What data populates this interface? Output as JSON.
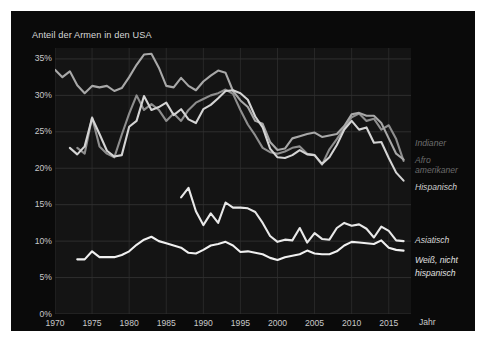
{
  "chart_data": {
    "type": "line",
    "title": "Anteil der Armen in den USA",
    "xlabel": "Jahr",
    "ylabel": "",
    "xlim": [
      1970,
      2018
    ],
    "ylim": [
      0,
      36.5
    ],
    "grid": true,
    "legend_position": "right-inline",
    "y_ticks": [
      "0%",
      "5%",
      "10%",
      "15%",
      "20%",
      "25%",
      "30%",
      "35%"
    ],
    "y_tick_values": [
      0,
      5,
      10,
      15,
      20,
      25,
      30,
      35
    ],
    "x_ticks": [
      "1970",
      "1975",
      "1980",
      "1985",
      "1990",
      "1995",
      "2000",
      "2005",
      "2010",
      "2015"
    ],
    "x_tick_values": [
      1970,
      1975,
      1980,
      1985,
      1990,
      1995,
      2000,
      2005,
      2010,
      2015
    ],
    "series": [
      {
        "name": "Indianer",
        "color": "#8e8e8e",
        "label_color": "#6f6f6f",
        "x": [
          1973,
          1974,
          1975,
          1976,
          1977,
          1978,
          1979,
          1980,
          1981,
          1982,
          1983,
          1984,
          1985,
          1986,
          1987,
          1988,
          1989,
          1990,
          1991,
          1992,
          1993,
          1994,
          1995,
          1996,
          1997,
          1998,
          1999,
          2000,
          2001,
          2002,
          2003,
          2004,
          2005,
          2006,
          2007,
          2008,
          2009,
          2010,
          2011,
          2012,
          2013,
          2014,
          2015,
          2016,
          2017
        ],
        "y": [
          22.8,
          22.0,
          27.0,
          23.0,
          22.0,
          21.5,
          24.6,
          27.5,
          30.0,
          28.0,
          28.8,
          28.0,
          26.5,
          27.5,
          26.5,
          28.0,
          29.0,
          29.5,
          30.0,
          30.3,
          30.8,
          30.2,
          28.0,
          26.0,
          24.5,
          22.8,
          22.2,
          22.0,
          22.3,
          22.8,
          23.0,
          22.0,
          21.8,
          20.5,
          22.6,
          24.0,
          25.5,
          27.0,
          27.5,
          26.5,
          26.8,
          25.3,
          25.9,
          24.0,
          21.0
        ]
      },
      {
        "name": "Afro-amerikaner",
        "color": "#a8a8a8",
        "label_color": "#6a6a6a",
        "x": [
          1970,
          1971,
          1972,
          1973,
          1974,
          1975,
          1976,
          1977,
          1978,
          1979,
          1980,
          1981,
          1982,
          1983,
          1984,
          1985,
          1986,
          1987,
          1988,
          1989,
          1990,
          1991,
          1992,
          1993,
          1994,
          1995,
          1996,
          1997,
          1998,
          1999,
          2000,
          2001,
          2002,
          2003,
          2004,
          2005,
          2006,
          2007,
          2008,
          2009,
          2010,
          2011,
          2012,
          2013,
          2014,
          2015,
          2016,
          2017
        ],
        "y": [
          33.5,
          32.5,
          33.3,
          31.4,
          30.3,
          31.3,
          31.1,
          31.3,
          30.6,
          31.0,
          32.5,
          34.2,
          35.6,
          35.7,
          33.8,
          31.3,
          31.1,
          32.4,
          31.3,
          30.7,
          31.9,
          32.7,
          33.4,
          33.1,
          30.6,
          29.3,
          28.4,
          26.5,
          26.1,
          23.6,
          22.5,
          22.7,
          24.1,
          24.4,
          24.7,
          24.9,
          24.3,
          24.5,
          24.7,
          25.8,
          27.4,
          27.6,
          27.2,
          27.2,
          26.2,
          24.1,
          22.0,
          21.2
        ]
      },
      {
        "name": "Hispanisch",
        "color": "#d4d4d4",
        "label_color": "#cfcfcf",
        "x": [
          1972,
          1973,
          1974,
          1975,
          1976,
          1977,
          1978,
          1979,
          1980,
          1981,
          1982,
          1983,
          1984,
          1985,
          1986,
          1987,
          1988,
          1989,
          1990,
          1991,
          1992,
          1993,
          1994,
          1995,
          1996,
          1997,
          1998,
          1999,
          2000,
          2001,
          2002,
          2003,
          2004,
          2005,
          2006,
          2007,
          2008,
          2009,
          2010,
          2011,
          2012,
          2013,
          2014,
          2015,
          2016,
          2017
        ],
        "y": [
          22.8,
          21.9,
          23.0,
          26.9,
          24.7,
          22.4,
          21.6,
          21.8,
          25.7,
          26.5,
          29.9,
          28.0,
          28.4,
          29.0,
          27.3,
          28.1,
          26.7,
          26.2,
          28.1,
          28.7,
          29.6,
          30.6,
          30.7,
          30.3,
          29.4,
          27.1,
          25.6,
          22.7,
          21.5,
          21.4,
          21.8,
          22.5,
          21.9,
          21.8,
          20.6,
          21.5,
          23.2,
          25.3,
          26.5,
          25.3,
          25.6,
          23.5,
          23.6,
          21.4,
          19.4,
          18.3
        ]
      },
      {
        "name": "Asiatisch",
        "color": "#e8e8e8",
        "label_color": "#d8d8d8",
        "x": [
          1987,
          1988,
          1989,
          1990,
          1991,
          1992,
          1993,
          1994,
          1995,
          1996,
          1997,
          1998,
          1999,
          2000,
          2001,
          2002,
          2003,
          2004,
          2005,
          2006,
          2007,
          2008,
          2009,
          2010,
          2011,
          2012,
          2013,
          2014,
          2015,
          2016,
          2017
        ],
        "y": [
          16.0,
          17.3,
          14.1,
          12.2,
          13.8,
          12.5,
          15.3,
          14.6,
          14.6,
          14.5,
          14.0,
          12.5,
          10.7,
          9.9,
          10.2,
          10.1,
          11.8,
          9.8,
          11.1,
          10.3,
          10.2,
          11.8,
          12.5,
          12.1,
          12.3,
          11.7,
          10.5,
          12.0,
          11.4,
          10.1,
          10.0
        ]
      },
      {
        "name": "Weiß, nicht hispanisch",
        "color": "#f0f0f0",
        "label_color": "#e0e0e0",
        "x": [
          1973,
          1974,
          1975,
          1976,
          1977,
          1978,
          1979,
          1980,
          1981,
          1982,
          1983,
          1984,
          1985,
          1986,
          1987,
          1988,
          1989,
          1990,
          1991,
          1992,
          1993,
          1994,
          1995,
          1996,
          1997,
          1998,
          1999,
          2000,
          2001,
          2002,
          2003,
          2004,
          2005,
          2006,
          2007,
          2008,
          2009,
          2010,
          2011,
          2012,
          2013,
          2014,
          2015,
          2016,
          2017
        ],
        "y": [
          7.5,
          7.5,
          8.6,
          7.8,
          7.8,
          7.8,
          8.1,
          8.6,
          9.5,
          10.2,
          10.6,
          10.0,
          9.7,
          9.4,
          9.1,
          8.4,
          8.3,
          8.8,
          9.4,
          9.6,
          9.9,
          9.4,
          8.5,
          8.6,
          8.4,
          8.2,
          7.7,
          7.4,
          7.8,
          8.0,
          8.2,
          8.7,
          8.3,
          8.2,
          8.2,
          8.6,
          9.4,
          9.9,
          9.8,
          9.7,
          9.6,
          10.1,
          9.1,
          8.8,
          8.7
        ]
      }
    ]
  },
  "legend": [
    {
      "label": "Indianer",
      "top": 127,
      "color": "#6f6f6f"
    },
    {
      "label": "Afro",
      "top": 144,
      "color": "#6a6a6a"
    },
    {
      "label": "amerikaner",
      "top": 154,
      "color": "#6a6a6a"
    },
    {
      "label": "Hispanisch",
      "top": 171,
      "color": "#cfcfcf"
    },
    {
      "label": "Asiatisch",
      "top": 224,
      "color": "#d8d8d8"
    },
    {
      "label": "Weiß, nicht",
      "top": 244,
      "color": "#e0e0e0"
    },
    {
      "label": "hispanisch",
      "top": 257,
      "color": "#e0e0e0"
    }
  ]
}
